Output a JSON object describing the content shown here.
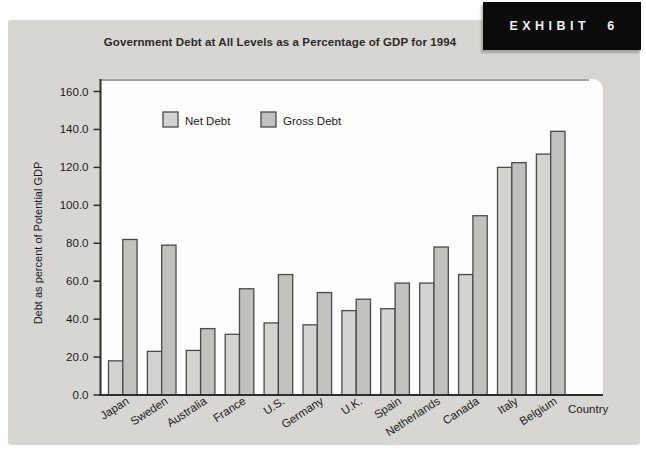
{
  "exhibit": {
    "label": "EXHIBIT 6",
    "bg": "#0b0b0b",
    "fg": "#f0efec"
  },
  "header": {
    "title": "Government Debt at All Levels as a Percentage of GDP for 1994"
  },
  "panel": {
    "bg": "#d7d6d2"
  },
  "chart_data": {
    "type": "bar",
    "title": "Government Debt at All Levels as a Percentage of GDP for 1994",
    "categories": [
      "Japan",
      "Sweden",
      "Australia",
      "France",
      "U.S.",
      "Germany",
      "U.K.",
      "Spain",
      "Netherlands",
      "Canada",
      "Italy",
      "Belgium"
    ],
    "series": [
      {
        "name": "Net Debt",
        "color": "#d3d3d0",
        "values": [
          18,
          23,
          23.5,
          32,
          38,
          37,
          44.5,
          45.5,
          59,
          63.5,
          120,
          127
        ]
      },
      {
        "name": "Gross Debt",
        "color": "#c1c1be",
        "values": [
          82,
          79,
          35,
          56,
          63.5,
          54,
          50.5,
          59,
          78,
          94.5,
          122.5,
          139
        ]
      }
    ],
    "xlabel": "Country",
    "ylabel": "Debt as percent of Potential GDP",
    "ylim": [
      0,
      160
    ],
    "yticks": [
      "0.0",
      "20.0",
      "40.0",
      "60.0",
      "80.0",
      "100.0",
      "120.0",
      "140.0",
      "160.0"
    ],
    "grid": false,
    "legend_position": "inside-top-left",
    "plot_bg": "#fdfdfb",
    "axis_color": "#2e2e2b",
    "bar_border_color": "#4a4a47",
    "text_color": "#1c1c1a",
    "plot_top_edge_color": "#908f8c"
  }
}
